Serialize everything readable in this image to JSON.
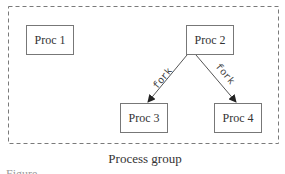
{
  "diagram": {
    "group": {
      "label": "Process group",
      "border_style": "dashed",
      "border_color": "#7a7a7a"
    },
    "nodes": [
      {
        "id": "proc1",
        "label": "Proc 1"
      },
      {
        "id": "proc2",
        "label": "Proc 2"
      },
      {
        "id": "proc3",
        "label": "Proc 3"
      },
      {
        "id": "proc4",
        "label": "Proc 4"
      }
    ],
    "edges": [
      {
        "from": "proc2",
        "to": "proc3",
        "label": "fork"
      },
      {
        "from": "proc2",
        "to": "proc4",
        "label": "fork"
      }
    ],
    "caption": "Figure ..."
  }
}
